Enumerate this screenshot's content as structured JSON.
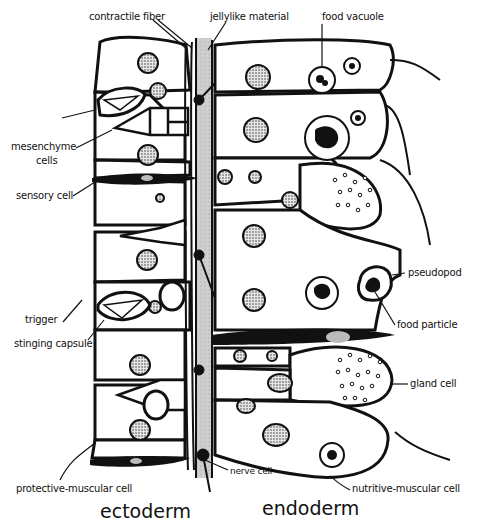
{
  "diagram": {
    "layers": {
      "ectoderm": "ectoderm",
      "endoderm": "endoderm"
    },
    "labels": {
      "contractile_fiber": "contractile fiber",
      "jellylike_material": "jellylike material",
      "food_vacuole": "food vacuole",
      "mesenchyme_cells_line1": "mesenchyme",
      "mesenchyme_cells_line2": "cells",
      "sensory_cell": "sensory cell",
      "pseudopod": "pseudopod",
      "trigger": "trigger",
      "stinging_capsule": "stinging capsule",
      "food_particle": "food particle",
      "gland_cell": "gland cell",
      "nerve_cell": "nerve cell",
      "protective_muscular_cell": "protective-muscular cell",
      "nutritive_muscular_cell": "nutritive-muscular cell"
    },
    "colors": {
      "ink": "#111111",
      "mesoglea": "#c8c8c8",
      "background": "#ffffff"
    }
  }
}
